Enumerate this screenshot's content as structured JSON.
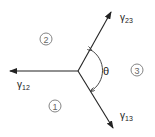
{
  "diagram": {
    "junction": {
      "x": 78,
      "y": 71
    },
    "vectors": [
      {
        "id": "gamma12",
        "label": "γ",
        "subscript": "12",
        "tip": {
          "x": 10,
          "y": 71
        },
        "label_pos": {
          "x": 17,
          "y": 88
        }
      },
      {
        "id": "gamma23",
        "label": "γ",
        "subscript": "23",
        "tip": {
          "x": 111,
          "y": 12
        },
        "label_pos": {
          "x": 120,
          "y": 21
        }
      },
      {
        "id": "gamma13",
        "label": "γ",
        "subscript": "13",
        "tip": {
          "x": 113,
          "y": 128
        },
        "label_pos": {
          "x": 120,
          "y": 119
        }
      }
    ],
    "angle": {
      "label": "θ"
    },
    "phases": [
      {
        "label": "1",
        "x": 55,
        "y": 106
      },
      {
        "label": "2",
        "x": 46,
        "y": 39
      },
      {
        "label": "3",
        "x": 137,
        "y": 70
      }
    ],
    "colors": {
      "line": "#222222",
      "phase_circle": "#777777"
    }
  }
}
